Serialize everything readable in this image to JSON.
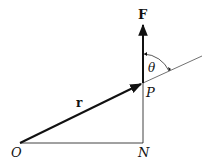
{
  "diagram": {
    "labels": {
      "force": "F",
      "position": "r",
      "angle": "θ",
      "point_p": "P",
      "origin": "O",
      "foot": "N"
    },
    "colors": {
      "stroke": "#111111",
      "background": "#ffffff"
    }
  }
}
